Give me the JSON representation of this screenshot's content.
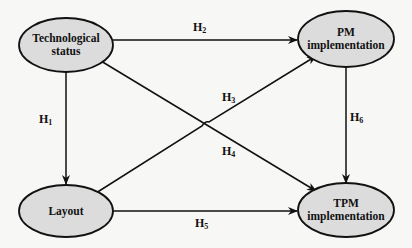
{
  "diagram": {
    "nodes": [
      {
        "id": "tech",
        "label_lines": [
          "Technological",
          "status"
        ],
        "cx": 66,
        "cy": 45,
        "rx": 47,
        "ry": 27
      },
      {
        "id": "pm",
        "label_lines": [
          "PM",
          "implementation"
        ],
        "cx": 346,
        "cy": 39,
        "rx": 48,
        "ry": 28
      },
      {
        "id": "layout",
        "label_lines": [
          "Layout"
        ],
        "cx": 66,
        "cy": 211,
        "rx": 47,
        "ry": 26
      },
      {
        "id": "tpm",
        "label_lines": [
          "TPM",
          "implementation"
        ],
        "cx": 346,
        "cy": 210,
        "rx": 48,
        "ry": 27
      }
    ],
    "edges": [
      {
        "from": "tech",
        "to": "pm",
        "label": "H",
        "sub": "2"
      },
      {
        "from": "tech",
        "to": "layout",
        "label": "H",
        "sub": "1"
      },
      {
        "from": "layout",
        "to": "pm",
        "label": "H",
        "sub": "3"
      },
      {
        "from": "tech",
        "to": "tpm",
        "label": "H",
        "sub": "4"
      },
      {
        "from": "layout",
        "to": "tpm",
        "label": "H",
        "sub": "5"
      },
      {
        "from": "pm",
        "to": "tpm",
        "label": "H",
        "sub": "6"
      }
    ],
    "colors": {
      "node_fill": "#dcdcdc",
      "stroke": "#111111",
      "background": "#f7f7f5"
    }
  }
}
